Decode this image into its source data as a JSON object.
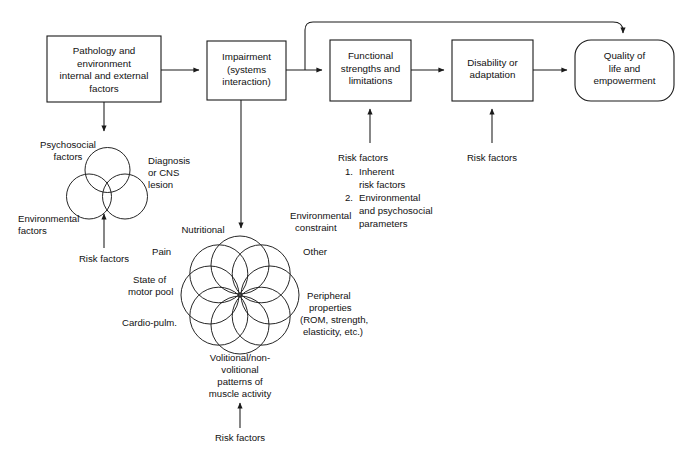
{
  "diagram": {
    "background_color": "#ffffff",
    "line_color": "#1a1a1a",
    "text_color": "#111111"
  },
  "boxes": [
    {
      "id": "pathology",
      "shape": "rect",
      "lines": [
        "Pathology and",
        "environment",
        "internal and external",
        "factors"
      ]
    },
    {
      "id": "impairment",
      "shape": "rect",
      "lines": [
        "Impairment",
        "(systems",
        "interaction)"
      ]
    },
    {
      "id": "functional",
      "shape": "rect",
      "lines": [
        "Functional",
        "strengths and",
        "limitations"
      ]
    },
    {
      "id": "disability",
      "shape": "rect",
      "lines": [
        "Disability or",
        "adaptation"
      ]
    },
    {
      "id": "quality",
      "shape": "rounded-rect",
      "lines": [
        "Quality of",
        "life and",
        "empowerment"
      ]
    }
  ],
  "venn": {
    "labels": {
      "psychosocial": [
        "Psychosocial",
        "factors"
      ],
      "diagnosis": [
        "Diagnosis",
        "or CNS",
        "lesion"
      ],
      "environmental": [
        "Environmental",
        "factors"
      ],
      "risk_factors": "Risk factors"
    }
  },
  "rosette": {
    "labels": {
      "nutritional": "Nutritional",
      "environmental_constraint": [
        "Environmental",
        "constraint"
      ],
      "pain": "Pain",
      "other": "Other",
      "state_of_motor_pool": [
        "State of",
        "motor pool"
      ],
      "peripheral": [
        "Peripheral",
        "properties",
        "(ROM, strength,",
        "elasticity, etc.)"
      ],
      "cardio": "Cardio-pulm.",
      "volitional": [
        "Volitional/non-",
        "volitional",
        "patterns of",
        "muscle activity"
      ],
      "risk_factors": "Risk factors"
    }
  },
  "annotations": {
    "functional_risk": {
      "heading": "Risk factors",
      "items": [
        {
          "num": "1.",
          "lines": [
            "Inherent",
            "risk factors"
          ]
        },
        {
          "num": "2.",
          "lines": [
            "Environmental",
            "and psychosocial",
            "parameters"
          ]
        }
      ]
    },
    "disability_risk": {
      "label": "Risk factors"
    }
  }
}
